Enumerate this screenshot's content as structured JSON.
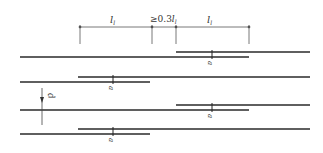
{
  "diagram": {
    "type": "rebar-lap-splice-staggering",
    "colors": {
      "line": "#2a2a2a",
      "dim": "#555555",
      "text": "#333333"
    },
    "dimension_row": {
      "segments": [
        {
          "label": "l",
          "subscript": "l",
          "from": 80,
          "to": 152
        },
        {
          "label": "≥0.3l",
          "subscript": "l",
          "from": 152,
          "to": 176
        },
        {
          "label": "l",
          "subscript": "l",
          "from": 176,
          "to": 249
        }
      ]
    },
    "spacing_label": "d",
    "splice_label": "a",
    "rows": [
      {
        "upper": [
          176,
          310,
          52
        ],
        "lower": [
          20,
          249,
          57
        ],
        "mark_x": 213
      },
      {
        "upper": [
          78,
          310,
          77
        ],
        "lower": [
          20,
          150,
          82
        ],
        "mark_x": 114
      },
      {
        "upper": [
          176,
          310,
          105
        ],
        "lower": [
          20,
          249,
          110
        ],
        "mark_x": 213
      },
      {
        "upper": [
          78,
          310,
          129
        ],
        "lower": [
          20,
          150,
          134
        ],
        "mark_x": 114
      }
    ]
  }
}
